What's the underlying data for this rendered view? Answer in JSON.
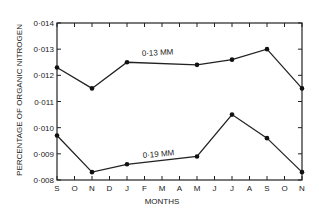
{
  "chart_data": {
    "type": "line",
    "title": "",
    "xlabel": "MONTHS",
    "ylabel": "PERCENTAGE OF ORGANIC NITROGEN",
    "ylim": [
      0.008,
      0.014
    ],
    "yticks": [
      "0.008",
      "0.009",
      "0.010",
      "0.011",
      "0.012",
      "0.013",
      "0.014"
    ],
    "categories": [
      "S",
      "O",
      "N",
      "D",
      "J",
      "F",
      "M",
      "A",
      "M",
      "J",
      "J",
      "A",
      "S",
      "O",
      "N"
    ],
    "grid": false,
    "legend": "inline labels",
    "series": [
      {
        "name": "0·13 MM",
        "points": [
          {
            "month_index": 0,
            "month": "S",
            "value": 0.0123
          },
          {
            "month_index": 2,
            "month": "N",
            "value": 0.0115
          },
          {
            "month_index": 4,
            "month": "J",
            "value": 0.0125
          },
          {
            "month_index": 8,
            "month": "M",
            "value": 0.0124
          },
          {
            "month_index": 10,
            "month": "J",
            "value": 0.0126
          },
          {
            "month_index": 12,
            "month": "S",
            "value": 0.013
          },
          {
            "month_index": 14,
            "month": "N",
            "value": 0.0115
          }
        ]
      },
      {
        "name": "0·19 MM",
        "points": [
          {
            "month_index": 0,
            "month": "S",
            "value": 0.0097
          },
          {
            "month_index": 2,
            "month": "N",
            "value": 0.0083
          },
          {
            "month_index": 4,
            "month": "J",
            "value": 0.0086
          },
          {
            "month_index": 8,
            "month": "M",
            "value": 0.0089
          },
          {
            "month_index": 10,
            "month": "J",
            "value": 0.0105
          },
          {
            "month_index": 12,
            "month": "S",
            "value": 0.0096
          },
          {
            "month_index": 14,
            "month": "N",
            "value": 0.0083
          }
        ]
      }
    ]
  },
  "labels": {
    "series_upper": "0·13 MM",
    "series_lower": "0·19 MM",
    "xlabel": "MONTHS",
    "ylabel": "PERCENTAGE OF ORGANIC NITROGEN",
    "yticks": [
      "0·008",
      "0·009",
      "0·010",
      "0·011",
      "0·012",
      "0·013",
      "0·014"
    ],
    "months": [
      "S",
      "O",
      "N",
      "D",
      "J",
      "F",
      "M",
      "A",
      "M",
      "J",
      "J",
      "A",
      "S",
      "O",
      "N"
    ]
  }
}
